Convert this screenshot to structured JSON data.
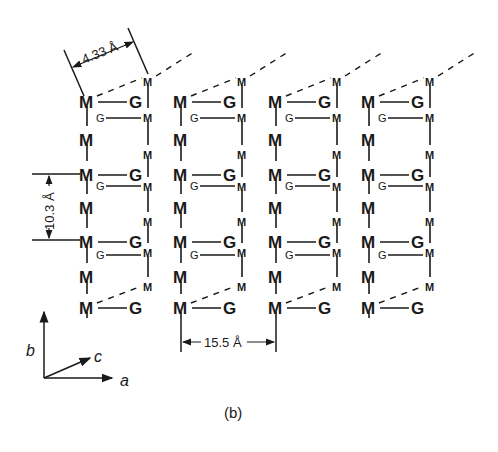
{
  "figure": {
    "caption": "(b)",
    "atoms": {
      "front_chain_label": "M",
      "guest_label": "G",
      "back_chain_label": "M",
      "back_guest_label": "G"
    },
    "dimensions": {
      "c_spacing": "4.33 Å",
      "b_spacing": "10.3 Å",
      "a_spacing": "15.5 Å"
    },
    "axes": {
      "a": "a",
      "b": "b",
      "c": "c"
    },
    "columns": 4,
    "colors": {
      "ink": "#1a1a1a",
      "background": "#ffffff"
    }
  }
}
